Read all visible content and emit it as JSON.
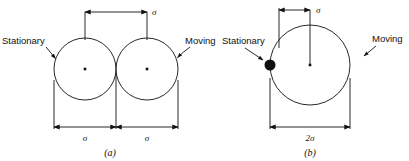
{
  "figure": {
    "type": "diagram",
    "background_color": "#ffffff",
    "line_color": "#111111"
  },
  "panels": [
    {
      "id": "a",
      "caption": "(a)",
      "annotations": {
        "stationary_label": "Stationary",
        "moving_label": "Moving"
      },
      "dimensions": {
        "top_center_to_center": "σ",
        "bottom_left_diameter": "σ",
        "bottom_right_diameter": "σ"
      },
      "circles": [
        {
          "name": "stationary-sphere",
          "cx": 85,
          "cy": 69,
          "r": 31,
          "center_dot": true
        },
        {
          "name": "moving-sphere",
          "cx": 147,
          "cy": 69,
          "r": 31,
          "center_dot": true
        }
      ]
    },
    {
      "id": "b",
      "caption": "(b)",
      "annotations": {
        "stationary_label": "Stationary",
        "moving_label": "Moving"
      },
      "dimensions": {
        "top_radius": "σ",
        "bottom_diameter": "2σ"
      },
      "circles": [
        {
          "name": "collision-cross-section-circle",
          "cx": 310,
          "cy": 65,
          "r": 40,
          "center_dot": true
        }
      ],
      "point_particle": {
        "name": "stationary-point",
        "cx": 270,
        "cy": 65,
        "r": 5.5,
        "filled": true
      }
    }
  ]
}
